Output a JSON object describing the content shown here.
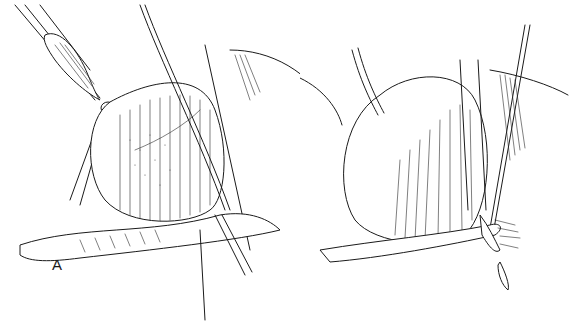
{
  "figure": {
    "type": "surgical line illustration",
    "colors": {
      "background": "#ffffff",
      "ink": "#1a1a1a"
    },
    "panels": [
      {
        "id": "A",
        "label": "A"
      },
      {
        "id": "B",
        "label": "B"
      }
    ]
  }
}
